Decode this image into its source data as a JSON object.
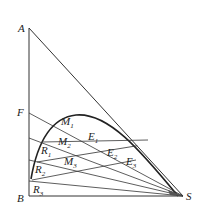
{
  "diagram": {
    "type": "ternary-extraction-diagram",
    "vertices": {
      "A": {
        "label": "A",
        "x": 29,
        "y": 28
      },
      "B": {
        "label": "B",
        "x": 29,
        "y": 196
      },
      "S": {
        "label": "S",
        "x": 183,
        "y": 196
      },
      "F": {
        "label": "F",
        "x": 29,
        "y": 113
      }
    },
    "labels": {
      "A": "A",
      "B": "B",
      "S": "S",
      "F": "F",
      "M1": "M",
      "M1_sub": "1",
      "M2": "M",
      "M2_sub": "2",
      "M3": "M",
      "M3_sub": "3",
      "E1": "E",
      "E1_sub": "1",
      "E2": "E",
      "E2_sub": "2",
      "E3": "E",
      "E3_sub": "3",
      "R1": "R",
      "R1_sub": "1",
      "R2": "R",
      "R2_sub": "2",
      "R3": "R",
      "R3_sub": "3"
    },
    "colors": {
      "line": "#333333",
      "curve": "#222222"
    }
  }
}
